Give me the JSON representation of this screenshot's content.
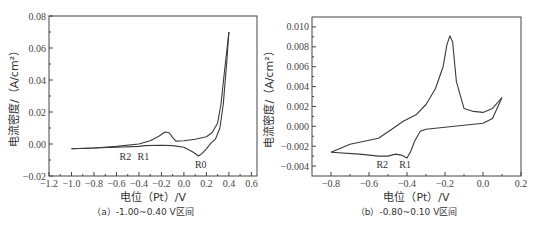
{
  "chart_data": [
    {
      "type": "line",
      "id": "a",
      "caption": "（a）-1.00~0.40 V区间",
      "xlabel": "电位（Pt）/V",
      "ylabel": "电流密度/（A/cm²）",
      "xlim": [
        -1.2,
        0.65
      ],
      "ylim": [
        -0.02,
        0.08
      ],
      "xticks": [
        "-1.2",
        "-1.0",
        "-0.8",
        "-0.6",
        "-0.4",
        "-0.2",
        "0.0",
        "0.2",
        "0.4",
        "0.6"
      ],
      "yticks": [
        "-0.02",
        "0.00",
        "0.02",
        "0.04",
        "0.06",
        "0.08"
      ],
      "annotations": [
        {
          "text": "R2",
          "x": -0.52,
          "y": -0.01
        },
        {
          "text": "R1",
          "x": -0.36,
          "y": -0.01
        },
        {
          "text": "R0",
          "x": 0.15,
          "y": -0.015
        }
      ],
      "series": [
        {
          "name": "forward scan",
          "x": [
            -1.0,
            -0.8,
            -0.6,
            -0.4,
            -0.3,
            -0.22,
            -0.17,
            -0.13,
            -0.1,
            -0.07,
            0.0,
            0.1,
            0.2,
            0.25,
            0.3,
            0.33,
            0.36,
            0.4
          ],
          "y": [
            -0.003,
            -0.0025,
            -0.0015,
            0.0,
            0.002,
            0.005,
            0.0075,
            0.007,
            0.004,
            0.0018,
            0.002,
            0.003,
            0.0045,
            0.007,
            0.013,
            0.025,
            0.045,
            0.07
          ]
        },
        {
          "name": "reverse scan",
          "x": [
            0.4,
            0.38,
            0.35,
            0.32,
            0.28,
            0.24,
            0.2,
            0.16,
            0.13,
            0.08,
            0.0,
            -0.1,
            -0.2,
            -0.35,
            -0.4,
            -0.6,
            -0.8,
            -1.0
          ],
          "y": [
            0.07,
            0.05,
            0.025,
            0.01,
            0.003,
            0.0005,
            -0.003,
            -0.006,
            -0.0075,
            -0.005,
            -0.002,
            -0.001,
            -0.0008,
            -0.001,
            -0.0015,
            -0.002,
            -0.0025,
            -0.003
          ]
        }
      ]
    },
    {
      "type": "line",
      "id": "b",
      "caption": "（b）-0.80~0.10 V区间",
      "xlabel": "电位（Pt）/V",
      "ylabel": "电流密度/（A/cm²）",
      "xlim": [
        -0.9,
        0.2
      ],
      "ylim": [
        -0.005,
        0.011
      ],
      "xticks": [
        "-0.8",
        "-0.6",
        "-0.4",
        "-0.2",
        "0.0",
        "0.2"
      ],
      "yticks": [
        "-0.004",
        "-0.002",
        "0.000",
        "0.002",
        "0.004",
        "0.006",
        "0.008",
        "0.010"
      ],
      "annotations": [
        {
          "text": "R2",
          "x": -0.53,
          "y": -0.0042
        },
        {
          "text": "R1",
          "x": -0.41,
          "y": -0.0042
        }
      ],
      "series": [
        {
          "name": "forward scan",
          "x": [
            -0.8,
            -0.7,
            -0.55,
            -0.48,
            -0.42,
            -0.35,
            -0.3,
            -0.25,
            -0.21,
            -0.19,
            -0.175,
            -0.16,
            -0.14,
            -0.1,
            -0.05,
            0.0,
            0.05,
            0.1
          ],
          "y": [
            -0.0026,
            -0.0018,
            -0.0012,
            -0.0003,
            0.0005,
            0.0012,
            0.0022,
            0.0038,
            0.006,
            0.0082,
            0.0091,
            0.0085,
            0.0045,
            0.0018,
            0.0015,
            0.0014,
            0.0018,
            0.0029
          ],
          "fill": false
        },
        {
          "name": "reverse scan",
          "x": [
            0.1,
            0.05,
            0.0,
            -0.1,
            -0.2,
            -0.3,
            -0.33,
            -0.36,
            -0.38,
            -0.4,
            -0.43,
            -0.46,
            -0.5,
            -0.55,
            -0.65,
            -0.8
          ],
          "y": [
            0.0029,
            0.0008,
            0.0003,
            0.0001,
            -0.0001,
            -0.0003,
            -0.0005,
            -0.0015,
            -0.0025,
            -0.0032,
            -0.0029,
            -0.0028,
            -0.003,
            -0.003,
            -0.0028,
            -0.0026
          ]
        }
      ]
    }
  ]
}
